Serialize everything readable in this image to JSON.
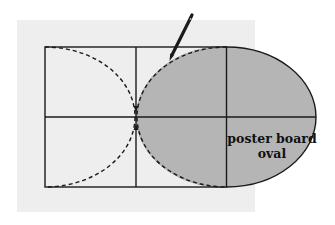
{
  "diagram": {
    "label": {
      "line1": "poster board",
      "line2": "oval"
    },
    "colors": {
      "background": "#ffffff",
      "board": "#eeeeee",
      "oval_fill": "#b5b5b5",
      "lines": "#1a1a1a"
    },
    "icons": {
      "pencil": "pencil-icon"
    }
  }
}
